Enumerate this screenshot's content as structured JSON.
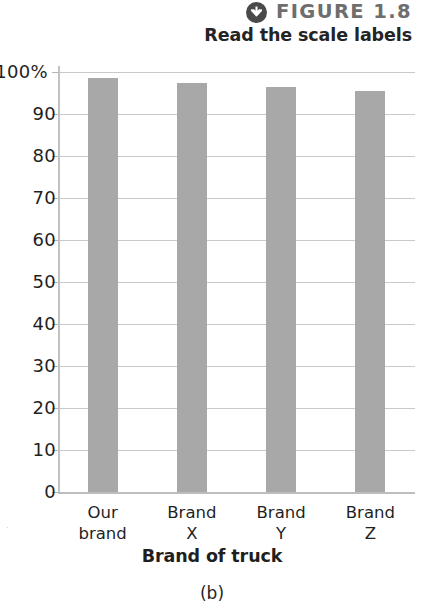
{
  "header": {
    "icon_name": "down-arrow-circle-icon",
    "figure_label": "FIGURE 1.8",
    "subtitle": "Read the scale labels",
    "label_color": "#6e6e6e",
    "subtitle_color": "#242424",
    "icon_color": "#4a4a4a"
  },
  "caption": "(b)",
  "corner_mark": ".",
  "chart_data": {
    "type": "bar",
    "title": "",
    "categories": [
      "Our\nbrand",
      "Brand\nX",
      "Brand\nY",
      "Brand\nZ"
    ],
    "values": [
      98.5,
      97.5,
      96.5,
      95.5
    ],
    "xlabel": "Brand of truck",
    "ylabel": "",
    "ylim": [
      0,
      100
    ],
    "yticks": [
      0,
      10,
      20,
      30,
      40,
      50,
      60,
      70,
      80,
      90,
      100
    ],
    "ytick_labels": [
      "0",
      "10",
      "20",
      "30",
      "40",
      "50",
      "60",
      "70",
      "80",
      "90",
      "100%"
    ],
    "grid": true,
    "legend": "none",
    "bar_color": "#a8a8a8",
    "gridline_color": "#c9c9c9",
    "axis_color": "#bdbdbd"
  }
}
